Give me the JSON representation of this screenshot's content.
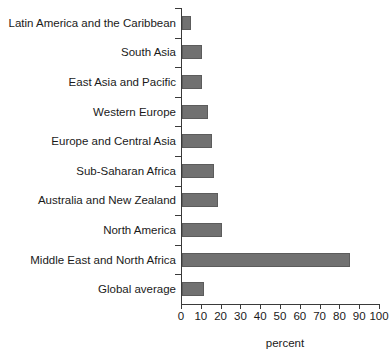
{
  "chart_data": {
    "type": "bar",
    "orientation": "horizontal",
    "title": "",
    "subtitle": "",
    "xlabel": "percent",
    "ylabel": "",
    "xlim": [
      0,
      100
    ],
    "xticks": [
      0,
      10,
      20,
      30,
      40,
      50,
      60,
      70,
      80,
      90,
      100
    ],
    "xtick_labels": [
      "0",
      "10",
      "20",
      "30",
      "40",
      "50",
      "60",
      "70",
      "80",
      "90",
      "100"
    ],
    "grid": false,
    "legend": null,
    "bar_color": "#717171",
    "bar_edge_color": "#5c5c5c",
    "axis_color": "#3a3a3a",
    "categories": [
      "Latin America and the Caribbean",
      "South Asia",
      "East Asia and Pacific",
      "Western Europe",
      "Europe and Central Asia",
      "Sub-Saharan Africa",
      "Australia and New Zealand",
      "North America",
      "Middle East and  North Africa",
      "Global average"
    ],
    "values": [
      4.5,
      10,
      10,
      13,
      15,
      16,
      18,
      20,
      85,
      11
    ],
    "series": [
      {
        "name": "percent",
        "values": [
          4.5,
          10,
          10,
          13,
          15,
          16,
          18,
          20,
          85,
          11
        ]
      }
    ]
  }
}
